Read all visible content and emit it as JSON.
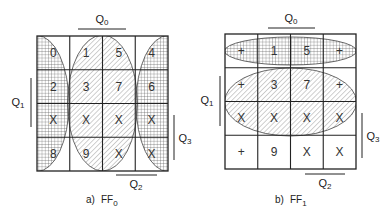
{
  "maps": [
    {
      "id": "ff0",
      "caption_prefix": "a)",
      "caption_main": "FF",
      "caption_sub": "0",
      "labels": {
        "top": {
          "main": "Q",
          "sub": "0"
        },
        "left": {
          "main": "Q",
          "sub": "1"
        },
        "right": {
          "main": "Q",
          "sub": "3"
        },
        "bottom": {
          "main": "Q",
          "sub": "2"
        }
      },
      "cells": [
        [
          "0",
          "1",
          "5",
          "4"
        ],
        [
          "2",
          "3",
          "7",
          "6"
        ],
        [
          "X",
          "X",
          "X",
          "X"
        ],
        [
          "8",
          "9",
          "X",
          "X"
        ]
      ],
      "groups": [
        {
          "name": "left-edge-group",
          "pattern": "crosshatch",
          "orientation": "vertical",
          "columns": [
            0
          ],
          "wraps": true
        },
        {
          "name": "center-group",
          "pattern": "diagonal",
          "orientation": "vertical",
          "columns": [
            1,
            2
          ]
        },
        {
          "name": "right-edge-group",
          "pattern": "crosshatch",
          "orientation": "vertical",
          "columns": [
            3
          ],
          "wraps": true
        }
      ]
    },
    {
      "id": "ff1",
      "caption_prefix": "b)",
      "caption_main": "FF",
      "caption_sub": "1",
      "labels": {
        "top": {
          "main": "Q",
          "sub": "0"
        },
        "left": {
          "main": "Q",
          "sub": "1"
        },
        "right": {
          "main": "Q",
          "sub": "3"
        },
        "bottom": {
          "main": "Q",
          "sub": "2"
        }
      },
      "cells": [
        [
          "+",
          "1",
          "5",
          "+"
        ],
        [
          "+",
          "3",
          "7",
          "+"
        ],
        [
          "X",
          "X",
          "X",
          "X"
        ],
        [
          "+",
          "9",
          "X",
          "X"
        ]
      ],
      "groups": [
        {
          "name": "top-row-group",
          "pattern": "crosshatch",
          "orientation": "horizontal",
          "rows": [
            0
          ]
        },
        {
          "name": "middle-rows-group",
          "pattern": "diagonal",
          "orientation": "horizontal",
          "rows": [
            1,
            2
          ]
        }
      ]
    }
  ]
}
